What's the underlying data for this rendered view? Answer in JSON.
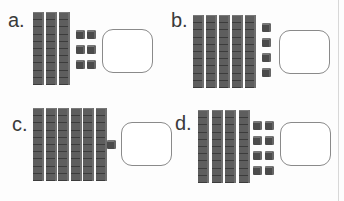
{
  "worksheet": {
    "problems": [
      {
        "label": "a.",
        "tens": 3,
        "ones": 6,
        "answer": ""
      },
      {
        "label": "b.",
        "tens": 5,
        "ones": 4,
        "answer": ""
      },
      {
        "label": "c.",
        "tens": 6,
        "ones": 1,
        "answer": ""
      },
      {
        "label": "d.",
        "tens": 4,
        "ones": 8,
        "answer": ""
      }
    ]
  },
  "colors": {
    "block": "#4b4b4b",
    "box_border": "#8a8a8a",
    "label": "#3a3a3a"
  }
}
